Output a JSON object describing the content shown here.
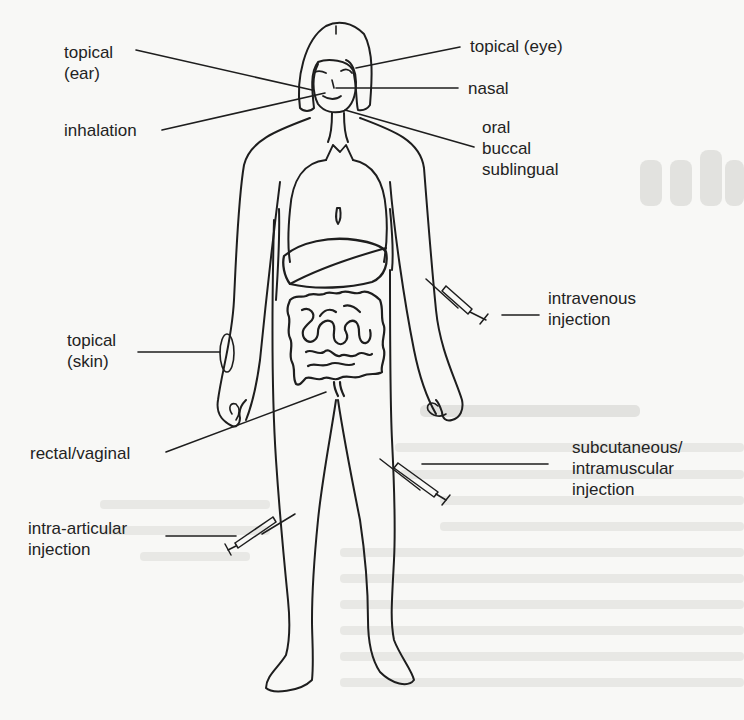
{
  "diagram": {
    "type": "anatomical-illustration",
    "labels": {
      "topical_ear": [
        "topical",
        "(ear)"
      ],
      "topical_eye": [
        "topical (eye)"
      ],
      "nasal": [
        "nasal"
      ],
      "inhalation": [
        "inhalation"
      ],
      "oral_group": [
        "oral",
        "buccal",
        "sublingual"
      ],
      "intravenous": [
        "intravenous",
        "injection"
      ],
      "topical_skin": [
        "topical",
        "(skin)"
      ],
      "rectal_vaginal": [
        "rectal/vaginal"
      ],
      "subcutaneous": [
        "subcutaneous/",
        "intramuscular",
        "injection"
      ],
      "intra_articular": [
        "intra-articular",
        "injection"
      ]
    },
    "icons": {
      "syringe": "syringe-icon",
      "skin_patch": "skin-patch-icon"
    },
    "colors": {
      "ink": "#1e1e1e",
      "paper": "#f8f8f6",
      "bleed_through": "#d9d9d6"
    }
  }
}
